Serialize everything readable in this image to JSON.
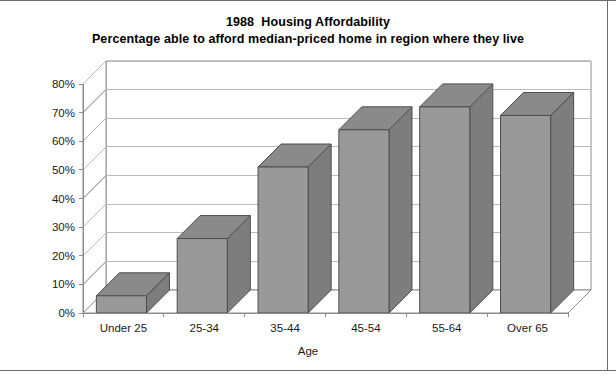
{
  "chart_data": {
    "type": "bar",
    "title": "1988  Housing Affordability",
    "subtitle": "Percentage able to afford median-priced home in region where they live",
    "categories": [
      "Under 25",
      "25-34",
      "35-44",
      "45-54",
      "55-64",
      "Over 65"
    ],
    "values": [
      6,
      26,
      51,
      64,
      72,
      69
    ],
    "xlabel": "Age",
    "ylabel": "",
    "ylim": [
      0,
      80
    ],
    "ytick_labels": [
      "0%",
      "10%",
      "20%",
      "30%",
      "40%",
      "50%",
      "60%",
      "70%",
      "80%"
    ],
    "ytick_values": [
      0,
      10,
      20,
      30,
      40,
      50,
      60,
      70,
      80
    ],
    "grid": true,
    "legend": false,
    "style": "3d-column",
    "colors": {
      "bar_front": "#999999",
      "bar_top": "#8a8a8a",
      "bar_side": "#7d7d7d",
      "bar_edge": "#4d4d4d",
      "grid": "#b9b9b9",
      "axis": "#8c8c8c",
      "frame_border": "#6b6b6b",
      "text": "#1a1a1a",
      "background": "#ffffff"
    }
  }
}
